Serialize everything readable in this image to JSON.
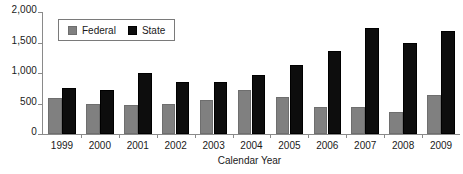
{
  "chart_data": {
    "type": "bar",
    "title": "",
    "subtitle": "",
    "xlabel": "Calendar Year",
    "ylabel": "",
    "categories": [
      "1999",
      "2000",
      "2001",
      "2002",
      "2003",
      "2004",
      "2005",
      "2006",
      "2007",
      "2008",
      "2009"
    ],
    "series": [
      {
        "name": "Federal",
        "color": "#808080",
        "values": [
          590,
          485,
          475,
          490,
          560,
          715,
          600,
          450,
          440,
          360,
          645
        ]
      },
      {
        "name": "State",
        "color": "#0d0d0d",
        "values": [
          755,
          720,
          1000,
          860,
          850,
          970,
          1135,
          1365,
          1730,
          1490,
          1685
        ]
      }
    ],
    "ylim": [
      0,
      2000
    ],
    "y_ticks": [
      0,
      500,
      1000,
      1500,
      2000
    ],
    "y_tick_labels": [
      "0",
      "500",
      "1,000",
      "1,500",
      "2,000"
    ],
    "grid": false,
    "legend_position": "top-left"
  },
  "legend": {
    "entries": [
      {
        "label": "Federal",
        "swatch": "federal-swatch-icon"
      },
      {
        "label": "State",
        "swatch": "state-swatch-icon"
      }
    ]
  },
  "axes": {
    "x_title": "Calendar Year"
  }
}
